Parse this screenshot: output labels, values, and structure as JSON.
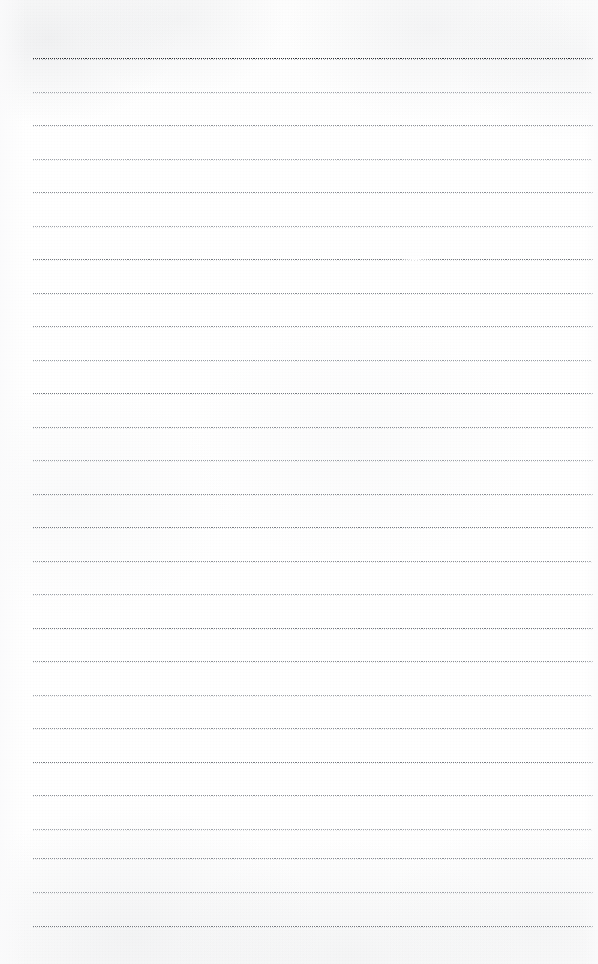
{
  "document": {
    "kind": "lined-notebook-page-scan",
    "title": "Blank ruled notebook page",
    "page_width_px": 598,
    "page_height_px": 964,
    "background_color": "#fefefe",
    "paper_tone": "off-white scanned paper",
    "written_content": "",
    "has_text": false,
    "has_margin_rule": false,
    "has_page_number": false
  },
  "ruling": {
    "line_count": 27,
    "first_line_y_px": 58,
    "line_spacing_px": 33.4,
    "line_left_px": 33,
    "line_right_px": 594,
    "line_thickness_px": 1,
    "default_color": "#8d9196",
    "first_line_color": "#2f3236",
    "lines": [
      {
        "index": 1,
        "y": 58,
        "weight": "first",
        "color": "#2f3236",
        "left": 33,
        "right": 594,
        "fade": null
      },
      {
        "index": 2,
        "y": 92,
        "weight": "light",
        "color": "#a2a6ac",
        "left": 33,
        "right": 592,
        "fade": null
      },
      {
        "index": 3,
        "y": 125,
        "weight": "medium",
        "color": "#8b8f95",
        "left": 33,
        "right": 594,
        "fade": null
      },
      {
        "index": 4,
        "y": 159,
        "weight": "light",
        "color": "#9ea2a8",
        "left": 33,
        "right": 592,
        "fade": null
      },
      {
        "index": 5,
        "y": 192,
        "weight": "medium",
        "color": "#8a8e94",
        "left": 33,
        "right": 594,
        "fade": null
      },
      {
        "index": 6,
        "y": 226,
        "weight": "light",
        "color": "#a0a4aa",
        "left": 33,
        "right": 593,
        "fade": null
      },
      {
        "index": 7,
        "y": 259,
        "weight": "dark",
        "color": "#74787d",
        "left": 33,
        "right": 594,
        "fade": {
          "start": 398,
          "width": 34
        }
      },
      {
        "index": 8,
        "y": 293,
        "weight": "medium",
        "color": "#888c92",
        "left": 33,
        "right": 593,
        "fade": null
      },
      {
        "index": 9,
        "y": 326,
        "weight": "medium",
        "color": "#8c9096",
        "left": 33,
        "right": 594,
        "fade": null
      },
      {
        "index": 10,
        "y": 360,
        "weight": "light",
        "color": "#9ba0a6",
        "left": 33,
        "right": 592,
        "fade": null
      },
      {
        "index": 11,
        "y": 393,
        "weight": "dark",
        "color": "#767a80",
        "left": 33,
        "right": 594,
        "fade": null
      },
      {
        "index": 12,
        "y": 427,
        "weight": "medium",
        "color": "#8a8e94",
        "left": 33,
        "right": 593,
        "fade": null
      },
      {
        "index": 13,
        "y": 460,
        "weight": "light",
        "color": "#9da1a7",
        "left": 33,
        "right": 594,
        "fade": null
      },
      {
        "index": 14,
        "y": 494,
        "weight": "medium",
        "color": "#888c92",
        "left": 33,
        "right": 593,
        "fade": null
      },
      {
        "index": 15,
        "y": 527,
        "weight": "dark",
        "color": "#787c82",
        "left": 33,
        "right": 594,
        "fade": null
      },
      {
        "index": 16,
        "y": 561,
        "weight": "medium",
        "color": "#8b8f95",
        "left": 33,
        "right": 592,
        "fade": null
      },
      {
        "index": 17,
        "y": 594,
        "weight": "light",
        "color": "#9ca0a6",
        "left": 33,
        "right": 594,
        "fade": null
      },
      {
        "index": 18,
        "y": 628,
        "weight": "dark",
        "color": "#74787e",
        "left": 33,
        "right": 593,
        "fade": null
      },
      {
        "index": 19,
        "y": 661,
        "weight": "medium",
        "color": "#898d93",
        "left": 33,
        "right": 594,
        "fade": null
      },
      {
        "index": 20,
        "y": 695,
        "weight": "light",
        "color": "#9fa3a9",
        "left": 33,
        "right": 592,
        "fade": null
      },
      {
        "index": 21,
        "y": 728,
        "weight": "medium",
        "color": "#8a8e94",
        "left": 33,
        "right": 594,
        "fade": null
      },
      {
        "index": 22,
        "y": 762,
        "weight": "dark",
        "color": "#777b81",
        "left": 33,
        "right": 593,
        "fade": null
      },
      {
        "index": 23,
        "y": 795,
        "weight": "medium",
        "color": "#8c9096",
        "left": 33,
        "right": 594,
        "fade": null
      },
      {
        "index": 24,
        "y": 829,
        "weight": "light",
        "color": "#9ea2a8",
        "left": 33,
        "right": 592,
        "fade": null
      },
      {
        "index": 25,
        "y": 858,
        "weight": "medium",
        "color": "#888c92",
        "left": 33,
        "right": 594,
        "fade": null
      },
      {
        "index": 26,
        "y": 892,
        "weight": "light",
        "color": "#9ca0a6",
        "left": 33,
        "right": 593,
        "fade": null
      },
      {
        "index": 27,
        "y": 926,
        "weight": "dark",
        "color": "#767a80",
        "left": 33,
        "right": 594,
        "fade": null
      }
    ]
  }
}
